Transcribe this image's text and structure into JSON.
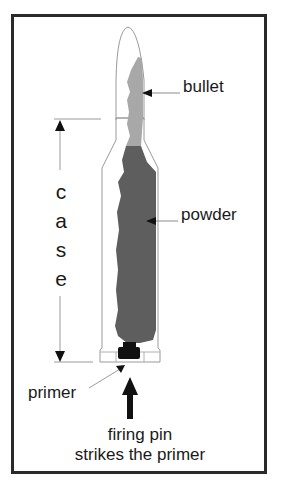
{
  "diagram": {
    "labels": {
      "bullet": "bullet",
      "powder": "powder",
      "primer": "primer",
      "case_letters": [
        "c",
        "a",
        "s",
        "e"
      ],
      "case": "case",
      "firing_line1": "firing pin",
      "firing_line2": "strikes the primer"
    },
    "colors": {
      "border": "#2a2a2a",
      "outline": "#9a9a9a",
      "bullet_fill": "#a8a8a8",
      "powder_fill": "#5e5e5e",
      "primer_fill": "#111111",
      "arrow": "#111111",
      "text": "#1a1a1a"
    }
  }
}
